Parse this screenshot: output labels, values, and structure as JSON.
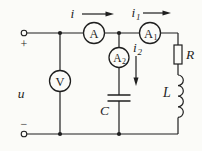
{
  "colors": {
    "line": "#1f1f1f",
    "background": "#fbfbf8"
  },
  "source": {
    "label": "u",
    "plus": "+",
    "minus": "−"
  },
  "currents": {
    "i": {
      "main": "i",
      "sub": ""
    },
    "i1": {
      "main": "i",
      "sub": "1"
    },
    "i2": {
      "main": "i",
      "sub": "2"
    }
  },
  "meters": {
    "ammeter": {
      "letter": "A",
      "sub": ""
    },
    "ammeter1": {
      "letter": "A",
      "sub": "1"
    },
    "ammeter2": {
      "letter": "A",
      "sub": "2"
    },
    "voltmeter": {
      "letter": "V",
      "sub": ""
    }
  },
  "components": {
    "resistor": {
      "label": "R"
    },
    "inductor": {
      "label": "L"
    },
    "capacitor": {
      "label": "C"
    }
  }
}
